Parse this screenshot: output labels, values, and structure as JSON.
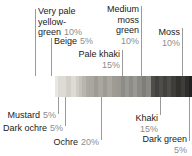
{
  "chart_data": {
    "type": "bar",
    "title": "",
    "subtitle": "",
    "xlabel": "",
    "ylabel": "",
    "orientation": "horizontal-stacked-proportion",
    "unit": "percent",
    "categories": [
      "Mustard",
      "Very pale yellow-green",
      "Beige",
      "Dark ochre",
      "Ochre",
      "Pale khaki",
      "Medium moss green",
      "Khaki",
      "Moss",
      "Dark green"
    ],
    "values": [
      5,
      10,
      5,
      5,
      20,
      15,
      10,
      15,
      10,
      5
    ],
    "colors": [
      "#e9e7e2",
      "#dedbd4",
      "#cfcdc6",
      "#b7b5ae",
      "#a9a7a0",
      "#9a9892",
      "#8b8a84",
      "#4e4d49",
      "#3e3d3a",
      "#2f2e2c"
    ],
    "grid": false,
    "legend": "callout-labels",
    "ylim": [
      0,
      100
    ]
  },
  "callouts": {
    "above": [
      {
        "name": "very-pale-yellow-green",
        "lines": [
          "Very pale",
          "yellow-"
        ],
        "last_line": "green",
        "percent": "10%"
      },
      {
        "name": "beige",
        "lines": [],
        "last_line": "Beige",
        "percent": "5%"
      },
      {
        "name": "pale-khaki",
        "lines": [
          "Pale khaki"
        ],
        "last_line": "",
        "percent": "15%"
      },
      {
        "name": "medium-moss-green",
        "lines": [
          "Medium",
          "moss",
          "green"
        ],
        "last_line": "",
        "percent": "10%"
      },
      {
        "name": "moss",
        "lines": [
          "Moss"
        ],
        "last_line": "",
        "percent": "10%"
      }
    ],
    "below": [
      {
        "name": "mustard",
        "label": "Mustard",
        "percent": "5%"
      },
      {
        "name": "dark-ochre",
        "label": "Dark ochre",
        "percent": "5%"
      },
      {
        "name": "ochre",
        "label": "Ochre",
        "percent": "20%"
      },
      {
        "name": "khaki",
        "label": "Khaki",
        "percent": "15%"
      },
      {
        "name": "dark-green",
        "label": "Dark green",
        "percent": "5%"
      }
    ]
  },
  "text": {
    "very_pale_l1": "Very pale",
    "very_pale_l2": "yellow-",
    "very_pale_l3": "green",
    "very_pale_pct": "10%",
    "beige_name": "Beige",
    "beige_pct": "5%",
    "pale_khaki_name": "Pale khaki",
    "pale_khaki_pct": "15%",
    "medium_moss_l1": "Medium",
    "medium_moss_l2": "moss",
    "medium_moss_l3": "green",
    "medium_moss_pct": "10%",
    "moss_name": "Moss",
    "moss_pct": "10%",
    "mustard_name": "Mustard",
    "mustard_pct": "5%",
    "dark_ochre_name": "Dark ochre",
    "dark_ochre_pct": "5%",
    "ochre_name": "Ochre",
    "ochre_pct": "20%",
    "khaki_name": "Khaki",
    "khaki_pct": "15%",
    "dark_green_name": "Dark green",
    "dark_green_pct": "5%"
  }
}
